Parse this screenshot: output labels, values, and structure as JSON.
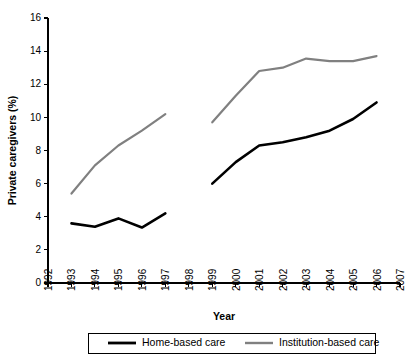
{
  "chart_data": {
    "type": "line",
    "title": "",
    "subtitle": "",
    "xlabel": "Year",
    "ylabel": "Private caregivers (%)",
    "xlim": [
      1992,
      2007
    ],
    "ylim": [
      0,
      16
    ],
    "ytick_step": 2,
    "grid": false,
    "legend_position": "bottom",
    "x_tick_labels": [
      "1992",
      "1993",
      "1994",
      "1995",
      "1996",
      "1997",
      "1998",
      "1999",
      "2000",
      "2001",
      "2002",
      "2003",
      "2004",
      "2005",
      "2006",
      "2007"
    ],
    "y_tick_labels": [
      "0",
      "2",
      "4",
      "6",
      "8",
      "10",
      "12",
      "14",
      "16"
    ],
    "series": [
      {
        "name": "Home-based care",
        "color": "#000000",
        "stroke_width": 2.6,
        "x": [
          1993,
          1994,
          1995,
          1996,
          1997,
          1999,
          2000,
          2001,
          2002,
          2003,
          2004,
          2005,
          2006
        ],
        "values": [
          3.6,
          3.4,
          3.9,
          3.35,
          4.2,
          6.0,
          7.3,
          8.3,
          8.5,
          8.8,
          9.2,
          9.9,
          10.9
        ],
        "segments": [
          {
            "x": [
              1993,
              1994,
              1995,
              1996,
              1997
            ],
            "values": [
              3.6,
              3.4,
              3.9,
              3.35,
              4.2
            ]
          },
          {
            "x": [
              1999,
              2000,
              2001,
              2002,
              2003,
              2004,
              2005,
              2006
            ],
            "values": [
              6.0,
              7.3,
              8.3,
              8.5,
              8.8,
              9.2,
              9.9,
              10.9
            ]
          }
        ]
      },
      {
        "name": "Institution-based care",
        "color": "#808080",
        "stroke_width": 2.2,
        "x": [
          1993,
          1994,
          1995,
          1996,
          1997,
          1999,
          2000,
          2001,
          2002,
          2003,
          2004,
          2005,
          2006
        ],
        "values": [
          5.4,
          7.1,
          8.3,
          9.2,
          10.2,
          9.7,
          11.3,
          12.8,
          13.0,
          13.55,
          13.4,
          13.4,
          13.7
        ],
        "segments": [
          {
            "x": [
              1993,
              1994,
              1995,
              1996,
              1997
            ],
            "values": [
              5.4,
              7.1,
              8.3,
              9.2,
              10.2
            ]
          },
          {
            "x": [
              1999,
              2000,
              2001,
              2002,
              2003,
              2004,
              2005,
              2006
            ],
            "values": [
              9.7,
              11.3,
              12.8,
              13.0,
              13.55,
              13.4,
              13.4,
              13.7
            ]
          }
        ]
      }
    ]
  },
  "legend": {
    "entries": [
      {
        "label": "Home-based care",
        "color": "#000000"
      },
      {
        "label": "Institution-based care",
        "color": "#808080"
      }
    ]
  }
}
